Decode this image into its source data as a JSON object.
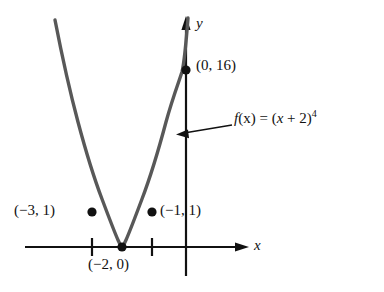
{
  "figure": {
    "background_color": "#ffffff",
    "axis_color": "#111111",
    "curve_color": "#585858",
    "point_color": "#111111"
  },
  "axes": {
    "x_label": "x",
    "y_label": "y",
    "x_tick_values": [
      -3,
      -1
    ],
    "origin_px": {
      "x": 186,
      "y": 247
    },
    "unit_px": 30
  },
  "labels": {
    "point_0_16": "(0, 16)",
    "point_m3_1": "(−3, 1)",
    "point_m1_1": "(−1, 1)",
    "point_m2_0": "(−2, 0)",
    "function_fx": "f",
    "function_arg": "(x)",
    "function_eq": " = (",
    "function_var": "x",
    "function_rest": " + 2)",
    "function_exp": "4"
  },
  "chart_data": {
    "type": "line",
    "subtitle": "",
    "xlabel": "x",
    "ylabel": "y",
    "equation": "f(x) = (x + 2)^4",
    "grid": false,
    "legend_position": "none",
    "xlim": [
      -5.4,
      1.8
    ],
    "ylim": [
      0,
      20
    ],
    "x_ticks": [
      -3,
      -1
    ],
    "x_tick_labels": [
      "",
      ""
    ],
    "y_ticks": [],
    "y_tick_labels": [],
    "series": [
      {
        "name": "f(x) = (x + 2)^4",
        "color": "#585858",
        "x": [
          -4.35,
          -4.2,
          -4.0,
          -3.8,
          -3.6,
          -3.4,
          -3.2,
          -3.0,
          -2.8,
          -2.6,
          -2.4,
          -2.2,
          -2.0,
          -1.8,
          -1.6,
          -1.4,
          -1.2,
          -1.0,
          -0.8,
          -0.6,
          -0.4,
          -0.2,
          0.0,
          0.12
        ],
        "y": [
          30.2,
          23.4,
          16.0,
          10.5,
          6.55,
          3.84,
          2.07,
          1.0,
          0.41,
          0.13,
          0.026,
          0.0016,
          0.0,
          0.0016,
          0.026,
          0.13,
          0.41,
          1.0,
          2.07,
          3.84,
          6.55,
          10.5,
          16.0,
          20.0
        ]
      }
    ],
    "annotated_points": [
      {
        "label": "(0, 16)",
        "x": 0,
        "y": 16
      },
      {
        "label": "(−3, 1)",
        "x": -3,
        "y": 1
      },
      {
        "label": "(−1, 1)",
        "x": -1,
        "y": 1
      },
      {
        "label": "(−2, 0)",
        "x": -2,
        "y": 0
      }
    ],
    "annotations": [
      {
        "text": "f(x) = (x + 2)^4",
        "points_to_x": -0.27,
        "points_to_y": 7.6
      }
    ]
  }
}
